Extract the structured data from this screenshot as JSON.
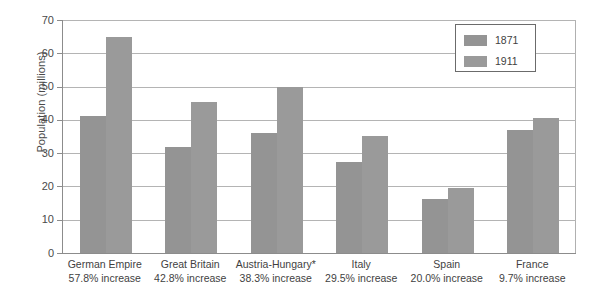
{
  "chart_data": {
    "type": "bar",
    "title": "",
    "xlabel": "",
    "ylabel": "Population (millions)",
    "ylim": [
      0,
      70
    ],
    "ytick_step": 10,
    "yticks": [
      0,
      10,
      20,
      30,
      40,
      50,
      60,
      70
    ],
    "grid": true,
    "legend_position": "top-right",
    "categories": [
      "German Empire",
      "Great Britain",
      "Austria-Hungary*",
      "Italy",
      "Spain",
      "France"
    ],
    "category_sublabels": [
      "57.8% increase",
      "42.8% increase",
      "38.3% increase",
      "29.5% increase",
      "20.0% increase",
      "9.7% increase"
    ],
    "series": [
      {
        "name": "1871",
        "color": "#949494",
        "values": [
          41.1,
          31.8,
          36.0,
          27.2,
          16.3,
          36.9
        ]
      },
      {
        "name": "1911",
        "color": "#9a9a9a",
        "values": [
          64.9,
          45.5,
          49.8,
          35.2,
          19.6,
          40.5
        ]
      }
    ]
  },
  "legend": {
    "items": [
      {
        "label": "1871"
      },
      {
        "label": "1911"
      }
    ]
  },
  "axis": {
    "y_title": "Population (millions)",
    "tick_labels": [
      "70",
      "60",
      "50",
      "40",
      "30",
      "20",
      "10",
      "0"
    ]
  },
  "footer": {
    "cut_off_text": ""
  }
}
